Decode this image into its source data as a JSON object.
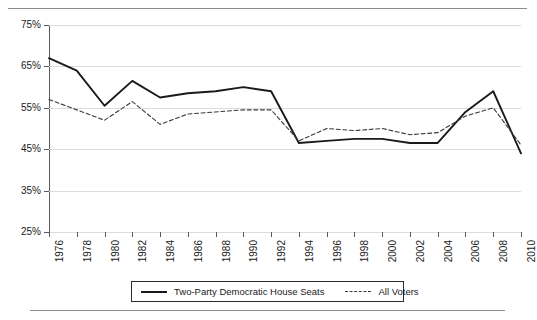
{
  "figure": {
    "title": "",
    "has_top_rule": true,
    "has_bottom_rule": true
  },
  "legend": {
    "position": "bottom-center",
    "entries": [
      {
        "label": "Two-Party Democratic House Seats",
        "style": "solid",
        "color": "#1a1a1a"
      },
      {
        "label": "All Voters",
        "style": "dashed",
        "color": "#3a3a3a"
      }
    ]
  },
  "axes": {
    "y_tick_labels": [
      "75%",
      "65%",
      "55%",
      "45%",
      "35%",
      "25%"
    ],
    "x_tick_labels": [
      "1976",
      "1978",
      "1980",
      "1982",
      "1984",
      "1986",
      "1988",
      "1990",
      "1992",
      "1994",
      "1996",
      "1998",
      "2000",
      "2002",
      "2004",
      "2006",
      "2008",
      "2010"
    ]
  },
  "chart_data": {
    "type": "line",
    "title": "",
    "xlabel": "",
    "ylabel": "",
    "xlim": [
      1976,
      2010
    ],
    "ylim": [
      25,
      75
    ],
    "ytick_values": [
      75,
      65,
      55,
      45,
      35,
      25
    ],
    "ytick_format": "percent",
    "grid": "horizontal",
    "legend_position": "bottom-center",
    "x": [
      1976,
      1978,
      1980,
      1982,
      1984,
      1986,
      1988,
      1990,
      1992,
      1994,
      1996,
      1998,
      2000,
      2002,
      2004,
      2006,
      2008,
      2010
    ],
    "series": [
      {
        "name": "Two-Party Democratic House Seats",
        "style": "solid",
        "color": "#1a1a1a",
        "values": [
          67.0,
          64.0,
          55.5,
          61.5,
          57.5,
          58.5,
          59.0,
          60.0,
          59.0,
          46.5,
          47.0,
          47.5,
          47.5,
          46.5,
          46.5,
          54.0,
          59.0,
          44.0
        ]
      },
      {
        "name": "All Voters",
        "style": "dashed",
        "color": "#3a3a3a",
        "values": [
          57.0,
          54.5,
          52.0,
          56.5,
          51.0,
          53.5,
          54.0,
          54.5,
          54.5,
          47.0,
          50.0,
          49.5,
          50.0,
          48.5,
          49.0,
          53.0,
          55.0,
          46.0
        ]
      }
    ]
  }
}
